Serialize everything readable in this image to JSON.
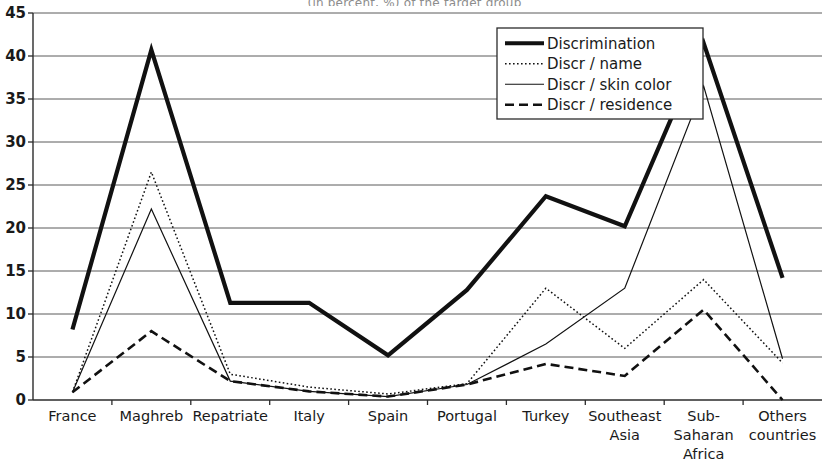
{
  "chart_data": {
    "type": "line",
    "title": "(in percent, %) of the target group",
    "xlabel": "",
    "ylabel": "",
    "ylim": [
      0,
      45
    ],
    "ytick_step": 5,
    "yticks": [
      "0",
      "5",
      "10",
      "15",
      "20",
      "25",
      "30",
      "35",
      "40",
      "45"
    ],
    "grid": true,
    "legend_position": "top-right",
    "categories": [
      "France",
      "Maghreb",
      "Repatriate",
      "Italy",
      "Spain",
      "Portugal",
      "Turkey",
      "Southeast\nAsia",
      "Sub-\nSaharan\nAfrica",
      "Others\ncountries"
    ],
    "series": [
      {
        "name": "Discrimination",
        "style": "thick-solid",
        "values": [
          8.2,
          40.7,
          11.3,
          11.3,
          5.2,
          12.8,
          23.7,
          20.2,
          41.5,
          14.2
        ]
      },
      {
        "name": "Discr / name",
        "style": "dotted",
        "values": [
          0.9,
          26.5,
          3.0,
          1.5,
          0.7,
          1.9,
          13.0,
          6.0,
          14.0,
          4.3
        ]
      },
      {
        "name": "Discr / skin color",
        "style": "thin-solid",
        "values": [
          0.9,
          22.2,
          2.2,
          1.0,
          0.4,
          1.8,
          6.5,
          13.0,
          36.5,
          4.8
        ]
      },
      {
        "name": "Discr / residence",
        "style": "dashed",
        "values": [
          0.9,
          8.0,
          2.2,
          1.0,
          0.4,
          1.8,
          4.2,
          2.8,
          10.5,
          0.0
        ]
      }
    ]
  },
  "colors": {
    "ink": "#111111",
    "grid": "#5a5a5a",
    "axis": "#2b2b2b",
    "background": "#ffffff"
  }
}
